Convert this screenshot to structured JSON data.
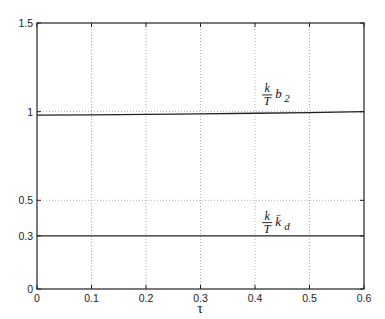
{
  "chart_data": {
    "type": "line",
    "title": "",
    "xlabel": "τ",
    "ylabel": "",
    "xlim": [
      0,
      0.6
    ],
    "ylim": [
      0,
      1.5
    ],
    "grid": true,
    "x_ticks": [
      "0",
      "0.1",
      "0.2",
      "0.3",
      "0.4",
      "0.5",
      "0.6"
    ],
    "x_tick_values": [
      0,
      0.1,
      0.2,
      0.3,
      0.4,
      0.5,
      0.6
    ],
    "y_ticks": [
      "0",
      "0.3",
      "0.5",
      "1",
      "1.5"
    ],
    "y_tick_values": [
      0,
      0.3,
      0.5,
      1,
      1.5
    ],
    "x": [
      0,
      0.1,
      0.2,
      0.3,
      0.4,
      0.5,
      0.6
    ],
    "series": [
      {
        "name": "k/T b2",
        "label_parts": {
          "num": "k",
          "den": "T",
          "sym": "b",
          "sub": "2"
        },
        "values": [
          0.98,
          0.982,
          0.985,
          0.988,
          0.991,
          0.995,
          1.0
        ],
        "label_pos": {
          "x": 0.415,
          "y": 1.1
        }
      },
      {
        "name": "k/T k̄d",
        "label_parts": {
          "num": "k",
          "den": "T",
          "sym": "k̄",
          "sub": "d"
        },
        "values": [
          0.3,
          0.3,
          0.3,
          0.3,
          0.3,
          0.3,
          0.3
        ],
        "label_pos": {
          "x": 0.415,
          "y": 0.38
        }
      }
    ],
    "legend": "none (inline annotations)"
  }
}
